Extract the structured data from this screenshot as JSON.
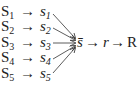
{
  "diagram": {
    "rows": [
      {
        "upper": "S",
        "lower": "s",
        "index": "1"
      },
      {
        "upper": "S",
        "lower": "s",
        "index": "2"
      },
      {
        "upper": "S",
        "lower": "s",
        "index": "3"
      },
      {
        "upper": "S",
        "lower": "s",
        "index": "4"
      },
      {
        "upper": "S",
        "lower": "s",
        "index": "5"
      }
    ],
    "arrow": "→",
    "aggregate": "s̄",
    "middle": "r",
    "result": "R"
  }
}
